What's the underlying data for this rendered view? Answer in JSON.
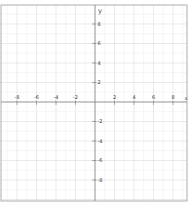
{
  "chart_data": {
    "type": "line",
    "title": "",
    "xlabel": "x",
    "ylabel": "y",
    "xlim": [
      -9.6,
      9.4
    ],
    "ylim": [
      -10.1,
      9.9
    ],
    "grid": true,
    "x_ticks": [
      -8,
      -6,
      -4,
      -2,
      2,
      4,
      6,
      8
    ],
    "y_ticks": [
      8,
      6,
      4,
      2,
      -2,
      -4,
      -6,
      -8
    ],
    "x_tick_labels": [
      "-8",
      "-6",
      "-4",
      "-2",
      "2",
      "4",
      "6",
      "8"
    ],
    "y_tick_labels": [
      "8",
      "6",
      "4",
      "2",
      "-2",
      "-4",
      "-6",
      "-8"
    ],
    "series": []
  },
  "layout": {
    "origin_px": [
      95,
      102
    ],
    "unit_px": 9.75,
    "frame": {
      "left": 1,
      "top": 5,
      "right": 187,
      "bottom": 201
    }
  },
  "colors": {
    "axis": "#888888",
    "grid_major": "#dcdcdc",
    "grid_minor": "#efefef",
    "frame": "#999999"
  }
}
